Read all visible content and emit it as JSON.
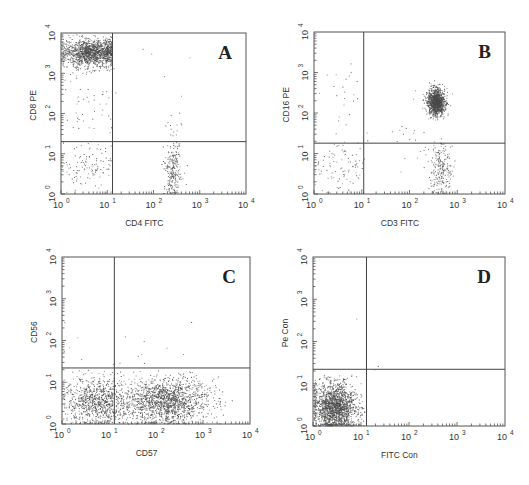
{
  "figure": {
    "width": 529,
    "height": 485,
    "colors": {
      "dots": "#4a4a4a",
      "frame": "#555555",
      "gate": "#444444",
      "text": "#333333"
    }
  },
  "chart_data": [
    {
      "type": "scatter",
      "panel": "A",
      "title": "A",
      "xlabel": "CD4 FITC",
      "ylabel": "CD8 PE",
      "xscale": "log",
      "yscale": "log",
      "xlim": [
        1,
        10000
      ],
      "ylim": [
        1,
        10000
      ],
      "xticks": [
        "10^0",
        "10^1",
        "10^2",
        "10^3",
        "10^4"
      ],
      "yticks": [
        "10^0",
        "10^1",
        "10^2",
        "10^3",
        "10^4"
      ],
      "quadrant_gate": {
        "x": 13,
        "y": 20
      },
      "grid": false,
      "legend": null,
      "box": {
        "left": 61,
        "top": 33,
        "right": 246,
        "bottom": 194
      },
      "clusters": [
        {
          "name": "CD8+ CD4- (upper left, dense)",
          "n": 1400,
          "cx_log": 0.65,
          "cy_log": 3.52,
          "sx": 0.32,
          "sy": 0.17,
          "xmax_log": 1.1,
          "ymax_log": 4.0
        },
        {
          "name": "CD8 dim scatter",
          "n": 45,
          "cx_log": 0.65,
          "cy_log": 2.2,
          "sx": 0.35,
          "sy": 0.6,
          "xmax_log": 1.1
        },
        {
          "name": "double negative (lower left)",
          "n": 110,
          "cx_log": 0.6,
          "cy_log": 0.65,
          "sx": 0.32,
          "sy": 0.32,
          "xmax_log": 1.1,
          "ymax_log": 1.25
        },
        {
          "name": "CD4+ CD8- (lower right)",
          "n": 230,
          "cx_log": 2.4,
          "cy_log": 0.6,
          "sx": 0.09,
          "sy": 0.35,
          "ymax_log": 1.3
        },
        {
          "name": "CD4 tail up",
          "n": 14,
          "cx_log": 2.45,
          "cy_log": 1.65,
          "sx": 0.08,
          "sy": 0.2
        },
        {
          "name": "sparse upper right",
          "n": 8,
          "cx_log": 1.9,
          "cy_log": 3.0,
          "sx": 0.5,
          "sy": 0.5
        }
      ]
    },
    {
      "type": "scatter",
      "panel": "B",
      "title": "B",
      "xlabel": "CD3 FITC",
      "ylabel": "CD16 PE",
      "xscale": "log",
      "yscale": "log",
      "xlim": [
        1,
        10000
      ],
      "ylim": [
        1,
        10000
      ],
      "xticks": [
        "10^0",
        "10^1",
        "10^2",
        "10^3",
        "10^4"
      ],
      "yticks": [
        "10^0",
        "10^1",
        "10^2",
        "10^3",
        "10^4"
      ],
      "quadrant_gate": {
        "x": 11,
        "y": 18
      },
      "grid": false,
      "legend": null,
      "box": {
        "left": 314,
        "top": 32,
        "right": 505,
        "bottom": 194
      },
      "clusters": [
        {
          "name": "CD3+ CD16+ (upper right, dense)",
          "n": 1100,
          "cx_log": 2.55,
          "cy_log": 2.28,
          "sx": 0.09,
          "sy": 0.16
        },
        {
          "name": "CD3+ CD16- (lower right)",
          "n": 220,
          "cx_log": 2.65,
          "cy_log": 0.6,
          "sx": 0.12,
          "sy": 0.35,
          "ymax_log": 1.28
        },
        {
          "name": "double negative (lower left)",
          "n": 90,
          "cx_log": 0.55,
          "cy_log": 0.65,
          "sx": 0.3,
          "sy": 0.3,
          "xmax_log": 1.05,
          "ymax_log": 1.28
        },
        {
          "name": "sparse upper left",
          "n": 22,
          "cx_log": 0.6,
          "cy_log": 2.4,
          "sx": 0.25,
          "sy": 0.6,
          "xmax_log": 1.05
        },
        {
          "name": "scatter between",
          "n": 30,
          "cx_log": 1.8,
          "cy_log": 1.3,
          "sx": 0.5,
          "sy": 0.5
        }
      ]
    },
    {
      "type": "scatter",
      "panel": "C",
      "title": "C",
      "xlabel": "CD57",
      "ylabel": "CD56",
      "xscale": "log",
      "yscale": "log",
      "xlim": [
        1,
        10000
      ],
      "ylim": [
        1,
        10000
      ],
      "xticks": [
        "10^0",
        "10^1",
        "10^2",
        "10^3",
        "10^4"
      ],
      "yticks": [
        "10^0",
        "10^1",
        "10^2",
        "10^3",
        "10^4"
      ],
      "quadrant_gate": {
        "x": 13,
        "y": 22
      },
      "grid": false,
      "legend": null,
      "box": {
        "left": 62,
        "top": 257,
        "right": 250,
        "bottom": 424
      },
      "clusters": [
        {
          "name": "CD56- CD57- (lower left)",
          "n": 900,
          "cx_log": 0.75,
          "cy_log": 0.55,
          "sx": 0.35,
          "sy": 0.28,
          "ymax_log": 1.3
        },
        {
          "name": "CD56- CD57+ (lower right, dense)",
          "n": 1500,
          "cx_log": 2.2,
          "cy_log": 0.55,
          "sx": 0.45,
          "sy": 0.28,
          "ymax_log": 1.3
        },
        {
          "name": "sparse upper",
          "n": 16,
          "cx_log": 1.5,
          "cy_log": 1.7,
          "sx": 0.9,
          "sy": 0.3
        }
      ]
    },
    {
      "type": "scatter",
      "panel": "D",
      "title": "D",
      "xlabel": "FITC Con",
      "ylabel": "Pe Con",
      "xscale": "log",
      "yscale": "log",
      "xlim": [
        1,
        10000
      ],
      "ylim": [
        1,
        10000
      ],
      "xticks": [
        "10^0",
        "10^1",
        "10^2",
        "10^3",
        "10^4"
      ],
      "yticks": [
        "10^0",
        "10^1",
        "10^2",
        "10^3",
        "10^4"
      ],
      "quadrant_gate": {
        "x": 13,
        "y": 22
      },
      "grid": false,
      "legend": null,
      "box": {
        "left": 313,
        "top": 257,
        "right": 505,
        "bottom": 426
      },
      "clusters": [
        {
          "name": "isotype control (lower left, dense)",
          "n": 1700,
          "cx_log": 0.45,
          "cy_log": 0.45,
          "sx": 0.22,
          "sy": 0.28,
          "xmax_log": 1.08,
          "ymax_log": 1.22
        },
        {
          "name": "stray",
          "n": 3,
          "cx_log": 1.2,
          "cy_log": 1.4,
          "sx": 0.2,
          "sy": 0.4
        }
      ]
    }
  ]
}
